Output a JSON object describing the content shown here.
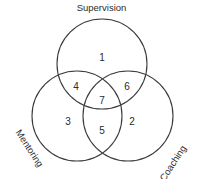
{
  "diagram": {
    "type": "venn-3-circle",
    "title": "",
    "background_color": "#ffffff",
    "stroke_color": "#3a3a3a",
    "text_color": "#2b2b2b",
    "set_labels": {
      "top": "Supervision",
      "bottom_left": "Mentoring",
      "bottom_right": "Coaching"
    },
    "regions": [
      {
        "id": "supervision-only",
        "number": "1",
        "x": 102,
        "y": 58
      },
      {
        "id": "coaching-only",
        "number": "2",
        "x": 132,
        "y": 122
      },
      {
        "id": "mentoring-only",
        "number": "3",
        "x": 68,
        "y": 122
      },
      {
        "id": "supervision-mentoring",
        "number": "4",
        "x": 76,
        "y": 87
      },
      {
        "id": "mentoring-coaching",
        "number": "5",
        "x": 102,
        "y": 131
      },
      {
        "id": "supervision-coaching",
        "number": "6",
        "x": 127,
        "y": 87
      },
      {
        "id": "supervision-mentoring-coaching",
        "number": "7",
        "x": 102,
        "y": 101
      }
    ],
    "circles": [
      {
        "id": "supervision-circle",
        "cx": 102,
        "cy": 64,
        "r": 45
      },
      {
        "id": "mentoring-circle",
        "cx": 77,
        "cy": 116,
        "r": 45
      },
      {
        "id": "coaching-circle",
        "cx": 128,
        "cy": 116,
        "r": 45
      }
    ]
  }
}
